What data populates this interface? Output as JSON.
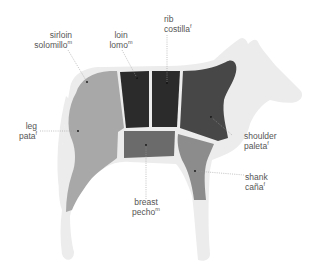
{
  "colors": {
    "silhouette": "#ececec",
    "light_cut": "#a8a8a8",
    "dark_cut": "#2b2b2b",
    "shoulder": "#474747",
    "breast": "#6b6b6b",
    "shank": "#8c8c8c",
    "leader": "#9a9a9a",
    "text": "#555555"
  },
  "cuts": [
    {
      "id": "sirloin",
      "en": "sirloin",
      "es": "solomillo",
      "gender": "m"
    },
    {
      "id": "loin",
      "en": "loin",
      "es": "lomo",
      "gender": "m"
    },
    {
      "id": "rib",
      "en": "rib",
      "es": "costilla",
      "gender": "f"
    },
    {
      "id": "leg",
      "en": "leg",
      "es": "pata",
      "gender": "f"
    },
    {
      "id": "shoulder",
      "en": "shoulder",
      "es": "paleta",
      "gender": "f"
    },
    {
      "id": "shank",
      "en": "shank",
      "es": "caña",
      "gender": "f"
    },
    {
      "id": "breast",
      "en": "breast",
      "es": "pecho",
      "gender": "m"
    }
  ]
}
